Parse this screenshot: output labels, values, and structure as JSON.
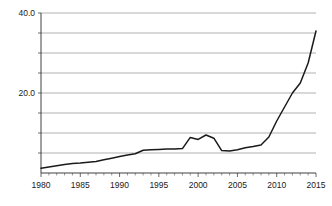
{
  "chart_data": {
    "type": "line",
    "title": "",
    "subtitle": "",
    "xlabel": "",
    "ylabel": "",
    "xlim": [
      1980,
      2015
    ],
    "ylim": [
      0,
      40
    ],
    "grid": true,
    "legend": null,
    "legend_position": "none",
    "y_tick_labels": [
      "40.0",
      "20.0"
    ],
    "y_tick_values": [
      40,
      20
    ],
    "y_gridline_values": [
      40,
      35,
      30,
      25,
      20,
      15,
      10,
      5
    ],
    "x_tick_labels": [
      "1980",
      "1985",
      "1990",
      "1995",
      "2000",
      "2005",
      "2010",
      "2015"
    ],
    "x_tick_values": [
      1980,
      1985,
      1990,
      1995,
      2000,
      2005,
      2010,
      2015
    ],
    "x_minor_tick_step": 1,
    "line_color": "#1a1a1a",
    "grid_color": "#8f8f8f",
    "axis_color": "#2b2b2b",
    "background_color": "#ffffff",
    "x": [
      1980,
      1981,
      1982,
      1983,
      1984,
      1985,
      1986,
      1987,
      1988,
      1989,
      1990,
      1991,
      1992,
      1993,
      1994,
      1995,
      1996,
      1997,
      1998,
      1999,
      2000,
      2001,
      2002,
      2003,
      2004,
      2005,
      2006,
      2007,
      2008,
      2009,
      2010,
      2011,
      2012,
      2013,
      2014,
      2015
    ],
    "values": [
      1.2,
      1.5,
      1.8,
      2.1,
      2.4,
      2.5,
      2.7,
      2.9,
      3.3,
      3.7,
      4.1,
      4.5,
      4.8,
      5.7,
      5.8,
      5.9,
      6.0,
      6.0,
      6.1,
      8.9,
      8.4,
      9.5,
      8.7,
      5.6,
      5.5,
      5.8,
      6.3,
      6.6,
      7.0,
      9.0,
      13.0,
      16.5,
      20.0,
      22.5,
      27.5,
      35.5
    ],
    "series": [
      {
        "name": "series-1",
        "values": [
          1.2,
          1.5,
          1.8,
          2.1,
          2.4,
          2.5,
          2.7,
          2.9,
          3.3,
          3.7,
          4.1,
          4.5,
          4.8,
          5.7,
          5.8,
          5.9,
          6.0,
          6.0,
          6.1,
          8.9,
          8.4,
          9.5,
          8.7,
          5.6,
          5.5,
          5.8,
          6.3,
          6.6,
          7.0,
          9.0,
          13.0,
          16.5,
          20.0,
          22.5,
          27.5,
          35.5
        ]
      }
    ]
  }
}
